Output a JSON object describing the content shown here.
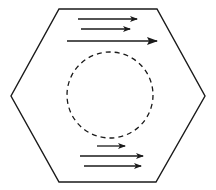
{
  "diagram": {
    "type": "hexagon-with-flow-arrows",
    "stroke_color": "#1a1a1a",
    "background_color": "#ffffff",
    "hexagon": {
      "points": [
        [
          59,
          9
        ],
        [
          157,
          9
        ],
        [
          205,
          96
        ],
        [
          156,
          182
        ],
        [
          59,
          182
        ],
        [
          11,
          96
        ]
      ],
      "stroke_width": 1.4
    },
    "circle": {
      "cx": 110,
      "cy": 95,
      "r": 43,
      "dashed": true,
      "dash": "5 4",
      "stroke_width": 1.3
    },
    "arrows_top": [
      {
        "x1": 78,
        "y1": 19,
        "x2": 137,
        "y2": 19,
        "head": "small"
      },
      {
        "x1": 81,
        "y1": 29,
        "x2": 130,
        "y2": 29,
        "head": "small"
      },
      {
        "x1": 67,
        "y1": 41,
        "x2": 157,
        "y2": 41,
        "head": "large"
      }
    ],
    "arrows_bottom": [
      {
        "x1": 97,
        "y1": 146,
        "x2": 125,
        "y2": 146,
        "head": "small"
      },
      {
        "x1": 80,
        "y1": 156,
        "x2": 143,
        "y2": 156,
        "head": "small"
      },
      {
        "x1": 84,
        "y1": 166,
        "x2": 141,
        "y2": 166,
        "head": "small"
      }
    ]
  }
}
